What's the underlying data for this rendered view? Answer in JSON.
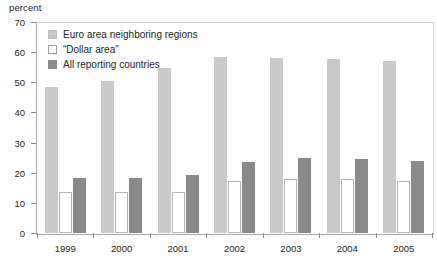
{
  "chart_data": {
    "type": "bar",
    "title": "",
    "subtitle": "",
    "xlabel": "",
    "ylabel": "percent",
    "ylim": [
      0,
      70
    ],
    "yticks": [
      0,
      10,
      20,
      30,
      40,
      50,
      60,
      70
    ],
    "grid": false,
    "legend_position": "top-left inside plot",
    "categories": [
      "1999",
      "2000",
      "2001",
      "2002",
      "2003",
      "2004",
      "2005"
    ],
    "series": [
      {
        "name": "Euro area neighboring regions",
        "color": "#c9c9c9",
        "values": [
          48.3,
          50.3,
          54.8,
          58.5,
          58.2,
          57.7,
          57.0
        ]
      },
      {
        "name": "“Dollar area”",
        "color": "#ffffff",
        "values": [
          13.6,
          13.7,
          13.6,
          17.3,
          17.8,
          17.8,
          17.2
        ]
      },
      {
        "name": "All reporting countries",
        "color": "#8a8a8a",
        "values": [
          18.2,
          18.4,
          19.1,
          23.6,
          25.0,
          24.5,
          23.8
        ]
      }
    ]
  },
  "axis": {
    "unit_label": "percent"
  },
  "colors": {
    "series_light": "#c9c9c9",
    "series_white": "#ffffff",
    "series_dark": "#8a8a8a",
    "axis_line": "#a8a8a8",
    "text": "#231f20"
  }
}
